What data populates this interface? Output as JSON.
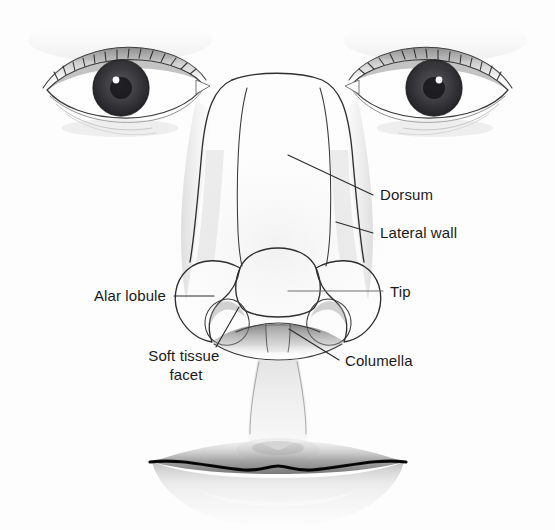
{
  "figure": {
    "background_color": "#fdfdfd",
    "ink_color": "#2e2e2e",
    "label_color": "#1a1a1a",
    "style": "pencil line drawing with graphite shading"
  },
  "labels": [
    {
      "id": "dorsum",
      "text": "Dorsum",
      "x": 380,
      "y": 200,
      "anchor": "start",
      "lines": [
        "Dorsum"
      ],
      "leader": {
        "x1": 288,
        "y1": 155,
        "x2": 373,
        "y2": 195
      }
    },
    {
      "id": "lateral-wall",
      "text": "Lateral wall",
      "x": 380,
      "y": 238,
      "anchor": "start",
      "lines": [
        "Lateral wall"
      ],
      "leader": {
        "x1": 336,
        "y1": 222,
        "x2": 373,
        "y2": 233
      }
    },
    {
      "id": "alar-lobule",
      "text": "Alar lobule",
      "x": 166,
      "y": 301,
      "anchor": "end",
      "lines": [
        "Alar lobule"
      ],
      "leader": {
        "x1": 174,
        "y1": 296,
        "x2": 214,
        "y2": 296
      }
    },
    {
      "id": "tip",
      "text": "Tip",
      "x": 390,
      "y": 297,
      "anchor": "start",
      "lines": [
        "Tip"
      ],
      "leader": {
        "x1": 288,
        "y1": 291,
        "x2": 383,
        "y2": 291
      }
    },
    {
      "id": "soft-tissue-facet",
      "text": "Soft tissue facet",
      "x": 186,
      "y": 361,
      "anchor": "middle",
      "lines": [
        "Soft tissue",
        "facet"
      ],
      "leader": {
        "x1": 239,
        "y1": 307,
        "x2": 216,
        "y2": 347
      }
    },
    {
      "id": "columella",
      "text": "Columella",
      "x": 345,
      "y": 366,
      "anchor": "start",
      "lines": [
        "Columella"
      ],
      "leader": {
        "x1": 289,
        "y1": 329,
        "x2": 339,
        "y2": 360
      }
    }
  ],
  "features": [
    {
      "id": "left-eye",
      "name": "left eye"
    },
    {
      "id": "right-eye",
      "name": "right eye"
    },
    {
      "id": "nose",
      "name": "nose"
    },
    {
      "id": "philtrum",
      "name": "philtrum"
    },
    {
      "id": "lips",
      "name": "lips"
    }
  ]
}
